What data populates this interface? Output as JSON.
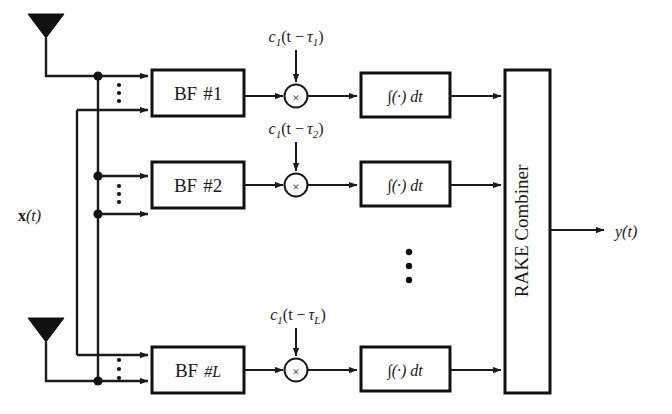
{
  "figure": {
    "type": "block-diagram",
    "background_color": "#ffffff",
    "line_color": "#1a1a1a"
  },
  "input": {
    "signal_label_main": "x",
    "signal_label_arg": "(t)",
    "antenna_count_shown": 2,
    "antenna_icon": "antenna-icon"
  },
  "output": {
    "signal_label_main": "y",
    "signal_label_arg": "(t)"
  },
  "combiner": {
    "label": "RAKE Combiner",
    "orientation": "vertical"
  },
  "branches": [
    {
      "id": "branch-1",
      "beamformer_label_prefix": "BF",
      "beamformer_label_index": "#1",
      "code_c": "c",
      "code_c_sub": "1",
      "code_arg_open": "(t −",
      "code_tau": "τ",
      "code_tau_sub": "1",
      "code_arg_close": ")",
      "multiplier_symbol": "×",
      "integrator_label": "∫(·) dt"
    },
    {
      "id": "branch-2",
      "beamformer_label_prefix": "BF",
      "beamformer_label_index": "#2",
      "code_c": "c",
      "code_c_sub": "1",
      "code_arg_open": "(t −",
      "code_tau": "τ",
      "code_tau_sub": "2",
      "code_arg_close": ")",
      "multiplier_symbol": "×",
      "integrator_label": "∫(·) dt"
    },
    {
      "id": "branch-L",
      "beamformer_label_prefix": "BF",
      "beamformer_label_index": "#L",
      "code_c": "c",
      "code_c_sub": "1",
      "code_arg_open": "(t −",
      "code_tau": "τ",
      "code_tau_sub": "L",
      "code_arg_close": ")",
      "multiplier_symbol": "×",
      "integrator_label": "∫(·) dt"
    }
  ],
  "ellipses": {
    "vertical_dots_glyph": "⋮",
    "between_branches": true,
    "inside_branch_inputs": true
  }
}
